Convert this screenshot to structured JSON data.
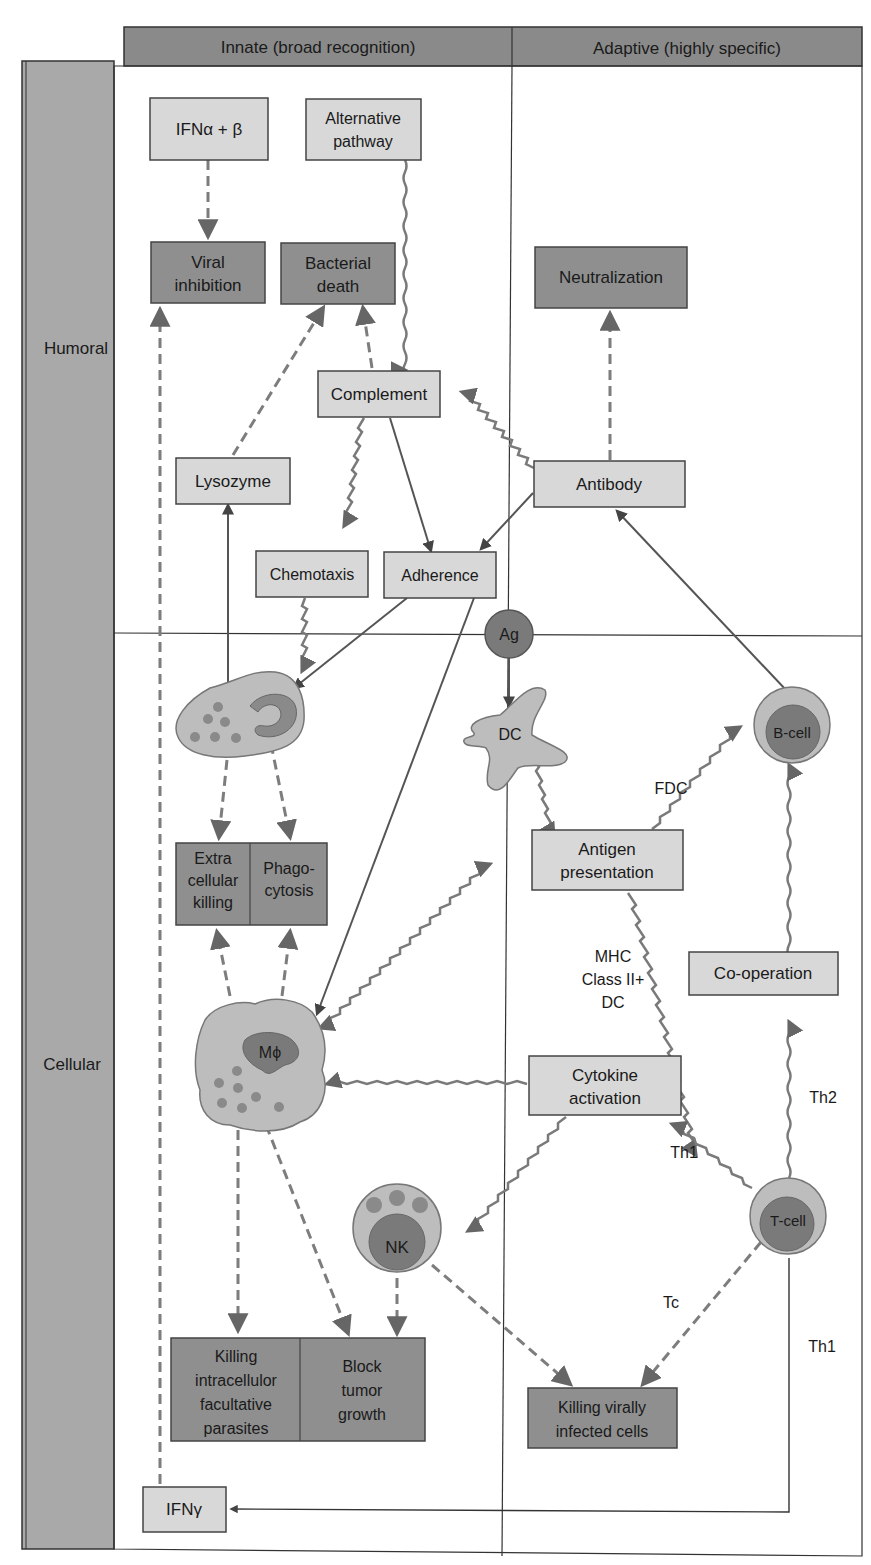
{
  "header": {
    "innate": "Innate (broad recognition)",
    "adaptive": "Adaptive (highly specific)"
  },
  "rows": {
    "humoral": "Humoral",
    "cellular": "Cellular"
  },
  "nodes": {
    "ifn_ab": "IFNα + β",
    "alt_pathway": [
      "Alternative",
      "pathway"
    ],
    "viral_inhibition": [
      "Viral",
      "inhibition"
    ],
    "bacterial_death": [
      "Bacterial",
      "death"
    ],
    "neutralization": "Neutralization",
    "complement": "Complement",
    "lysozyme": "Lysozyme",
    "antibody": "Antibody",
    "chemotaxis": "Chemotaxis",
    "adherence": "Adherence",
    "ag": "Ag",
    "dc": "DC",
    "b_cell": "B-cell",
    "extracellular_killing": [
      "Extra",
      "cellular",
      "killing"
    ],
    "phagocytosis": [
      "Phago-",
      "cytosis"
    ],
    "antigen_presentation": [
      "Antigen",
      "presentation"
    ],
    "co_operation": "Co-operation",
    "macrophage": "Mϕ",
    "cytokine_activation": [
      "Cytokine",
      "activation"
    ],
    "nk": "NK",
    "t_cell": "T-cell",
    "killing_intracellular": [
      "Killing",
      "intracellulor",
      "facultative",
      "parasites"
    ],
    "block_tumor": [
      "Block",
      "tumor",
      "growth"
    ],
    "killing_virally": [
      "Killing virally",
      "infected cells"
    ],
    "ifn_gamma": "IFNγ"
  },
  "edge_labels": {
    "fdc": "FDC",
    "mhc": [
      "MHC",
      "Class II+",
      "DC"
    ],
    "th2": "Th2",
    "th1_a": "Th1",
    "tc": "Tc",
    "th1_b": "Th1"
  },
  "legend_colors": {
    "light_box": "#d8d8d8",
    "dark_box": "#8f8f8f",
    "header": "#8a8a8a",
    "arrow": "#7a7a7a"
  }
}
